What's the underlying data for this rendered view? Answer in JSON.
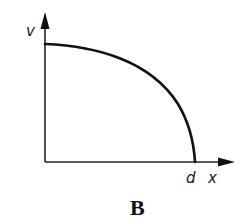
{
  "diagram": {
    "panel_label": "B",
    "y_axis_label": "v",
    "x_axis_label": "x",
    "x_intercept_label": "d",
    "curve_description": "concave-down curve from a positive v-intercept decreasing to zero at x = d (quarter-ellipse shape)",
    "colors": {
      "line": "#111111",
      "background": "#ffffff"
    }
  }
}
